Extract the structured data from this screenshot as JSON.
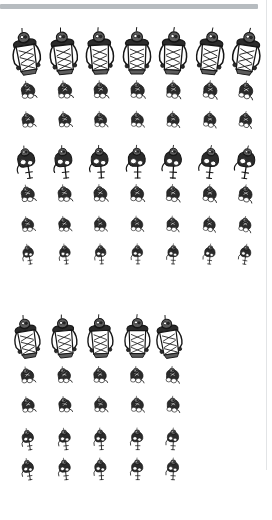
{
  "canvas": {
    "width": 272,
    "height": 520,
    "background": "#ffffff"
  },
  "top_bar": {
    "name": "top-gray-bar",
    "x": 0,
    "y": 4,
    "width": 258,
    "height": 5,
    "color": "#b7bcc0"
  },
  "edge_rule": {
    "name": "right-edge-rule",
    "x": 266,
    "y": 0,
    "width": 1,
    "height": 470,
    "color": "#e2e4e6"
  },
  "ink": {
    "stroke": "#161616",
    "fill_dark": "#2b2b2b",
    "fill_mid": "#5d5d5d",
    "fill_light": "#8d8d8d",
    "paper": "#ffffff"
  },
  "blocks": [
    {
      "name": "sprite-block-upper",
      "columns": 7,
      "rows": 7,
      "col_x": [
        30,
        66,
        101,
        137,
        172,
        208,
        243
      ],
      "row_y": [
        54,
        92,
        122,
        163,
        196,
        226,
        255
      ],
      "row_scale": [
        1.0,
        0.62,
        0.56,
        0.84,
        0.6,
        0.54,
        0.52
      ],
      "row_pose": [
        "stand",
        "crouch",
        "crouch",
        "lunge",
        "crouch",
        "crouch",
        "lunge"
      ],
      "labels": [
        [
          "r1c1",
          "r1c2",
          "r1c3",
          "r1c4",
          "r1c5",
          "r1c6",
          "r1c7"
        ],
        [
          "r2c1",
          "r2c2",
          "r2c3",
          "r2c4",
          "r2c5",
          "r2c6",
          "r2c7"
        ],
        [
          "r3c1",
          "r3c2",
          "r3c3",
          "r3c4",
          "r3c5",
          "r3c6",
          "r3c7"
        ],
        [
          "r4c1",
          "r4c2",
          "r4c3",
          "r4c4",
          "r4c5",
          "r4c6",
          "r4c7"
        ],
        [
          "r5c1",
          "r5c2",
          "r5c3",
          "r5c4",
          "r5c5",
          "r5c6",
          "r5c7"
        ],
        [
          "r6c1",
          "r6c2",
          "r6c3",
          "r6c4",
          "r6c5",
          "r6c6",
          "r6c7"
        ],
        [
          "r7c1",
          "r7c2",
          "r7c3",
          "r7c4",
          "r7c5",
          "r7c6",
          "r7c7"
        ]
      ],
      "variants": [
        [
          0,
          1,
          2,
          3,
          4,
          5,
          6
        ],
        [
          0,
          1,
          2,
          3,
          4,
          5,
          6
        ],
        [
          0,
          1,
          2,
          3,
          4,
          5,
          6
        ],
        [
          0,
          1,
          2,
          3,
          4,
          5,
          6
        ],
        [
          0,
          1,
          2,
          3,
          4,
          5,
          6
        ],
        [
          0,
          1,
          2,
          3,
          4,
          5,
          6
        ],
        [
          0,
          1,
          2,
          3,
          4,
          5,
          6
        ]
      ]
    },
    {
      "name": "sprite-block-lower",
      "columns": 5,
      "rows": 5,
      "col_x": [
        30,
        66,
        101,
        137,
        172
      ],
      "row_y": [
        339,
        377,
        407,
        440,
        470
      ],
      "row_scale": [
        0.92,
        0.58,
        0.56,
        0.56,
        0.56
      ],
      "row_pose": [
        "stand",
        "crouch",
        "crouch",
        "lunge",
        "lunge"
      ],
      "labels": [
        [
          "b2r1c1",
          "b2r1c2",
          "b2r1c3",
          "b2r1c4",
          "b2r1c5"
        ],
        [
          "b2r2c1",
          "b2r2c2",
          "b2r2c3",
          "b2r2c4",
          "b2r2c5"
        ],
        [
          "b2r3c1",
          "b2r3c2",
          "b2r3c3",
          "b2r3c4",
          "b2r3c5"
        ],
        [
          "b2r4c1",
          "b2r4c2",
          "b2r4c3",
          "b2r4c4",
          "b2r4c5"
        ],
        [
          "b2r5c1",
          "b2r5c2",
          "b2r5c3",
          "b2r5c4",
          "b2r5c5"
        ]
      ],
      "variants": [
        [
          0,
          1,
          2,
          3,
          0
        ],
        [
          0,
          1,
          2,
          3,
          4
        ],
        [
          0,
          1,
          2,
          3,
          4
        ],
        [
          0,
          1,
          2,
          3,
          4
        ],
        [
          0,
          1,
          2,
          3,
          4
        ]
      ]
    }
  ],
  "sprite_semantics": {
    "kind": "humanoid-figure-sprite",
    "description": "ink-drawn armored humanoid figure",
    "poses": [
      "stand",
      "crouch",
      "lunge"
    ]
  }
}
